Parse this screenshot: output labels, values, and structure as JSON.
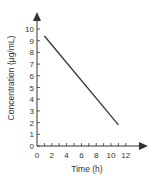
{
  "chart_data": {
    "type": "line",
    "title": "",
    "xlabel": "Time (h)",
    "ylabel": "Concentration (µg/mL)",
    "xlim": [
      0,
      12
    ],
    "ylim": [
      0,
      10
    ],
    "x_ticks": [
      "0",
      "2",
      "4",
      "6",
      "8",
      "10",
      "12"
    ],
    "y_ticks": [
      "0",
      "1",
      "2",
      "3",
      "4",
      "5",
      "6",
      "7",
      "8",
      "9",
      "10"
    ],
    "grid": false,
    "legend": null,
    "series": [
      {
        "name": "Concentration",
        "x": [
          1,
          11
        ],
        "y": [
          9.4,
          1.8
        ],
        "color": "#333333"
      }
    ]
  }
}
